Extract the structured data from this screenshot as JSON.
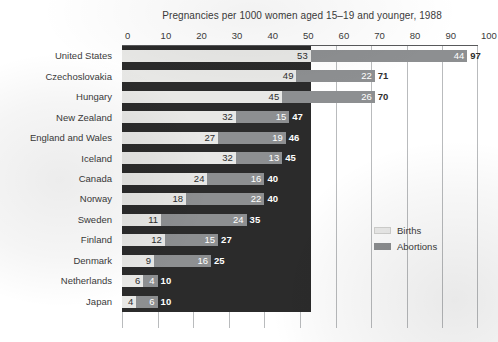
{
  "chart_data": {
    "type": "bar",
    "orientation": "horizontal",
    "stacked": true,
    "title": "Pregnancies per 1000 women aged 15–19 and younger, 1988",
    "xlabel": "",
    "ylabel": "",
    "xlim": [
      0,
      100
    ],
    "xticks": [
      "0",
      "10",
      "20",
      "30",
      "40",
      "50",
      "60",
      "70",
      "80",
      "90",
      "100"
    ],
    "grid": "vertical",
    "legend_position": "inside-right",
    "categories": [
      "United States",
      "Czechoslovakia",
      "Hungary",
      "New Zealand",
      "England and Wales",
      "Iceland",
      "Canada",
      "Norway",
      "Sweden",
      "Finland",
      "Denmark",
      "Netherlands",
      "Japan"
    ],
    "series": [
      {
        "name": "Births",
        "color": "#e8e8e6",
        "values": [
          53,
          49,
          45,
          32,
          27,
          32,
          24,
          18,
          11,
          12,
          9,
          6,
          4
        ]
      },
      {
        "name": "Abortions",
        "color": "#8d8f91",
        "values": [
          44,
          22,
          26,
          15,
          19,
          13,
          16,
          22,
          24,
          15,
          16,
          4,
          6
        ]
      }
    ],
    "totals": [
      97,
      71,
      70,
      47,
      46,
      45,
      40,
      40,
      35,
      27,
      25,
      10,
      10
    ]
  },
  "legend": {
    "items": [
      {
        "label": "Births",
        "swatch": "births-swatch"
      },
      {
        "label": "Abortions",
        "swatch": "abortions-swatch"
      }
    ]
  },
  "colors": {
    "births": "#e8e8e6",
    "abortions": "#8d8f91",
    "plot_backdrop": "#2b2b2b",
    "gridline": "#b9bbbd",
    "text": "#3b3b3b"
  }
}
